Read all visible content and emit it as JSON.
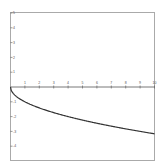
{
  "chart_data": {
    "type": "line",
    "title": "",
    "xlabel": "",
    "ylabel": "",
    "xlim": [
      0,
      10
    ],
    "ylim": [
      -5,
      5
    ],
    "grid": false,
    "legend": null,
    "x_ticks": [
      "1",
      "2",
      "3",
      "4",
      "5",
      "6",
      "7",
      "8",
      "9",
      "10"
    ],
    "y_ticks": [
      "5",
      "4",
      "3",
      "2",
      "1",
      "-1",
      "-2",
      "-3",
      "-4"
    ],
    "series": [
      {
        "name": "y = -sqrt(x)",
        "x": [
          0,
          0.1,
          0.25,
          0.5,
          1,
          1.5,
          2,
          3,
          4,
          5,
          6,
          7,
          8,
          9,
          10
        ],
        "y": [
          0,
          -0.32,
          -0.5,
          -0.71,
          -1,
          -1.22,
          -1.41,
          -1.73,
          -2,
          -2.24,
          -2.45,
          -2.65,
          -2.83,
          -3,
          -3.16
        ]
      }
    ],
    "colors": {
      "curve": "#333333",
      "axis": "#555555",
      "frame": "#aaaaaa"
    }
  }
}
